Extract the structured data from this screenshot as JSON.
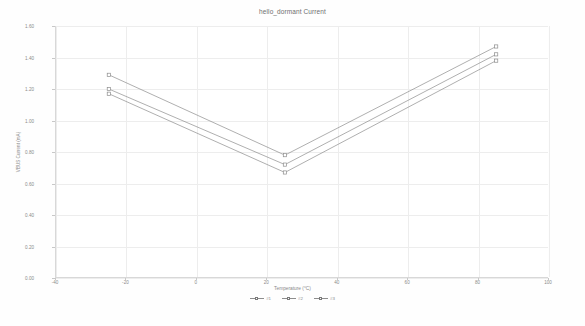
{
  "chart_data": {
    "type": "line",
    "title": "hello_dormant Current",
    "xlabel": "Temperature (°C)",
    "ylabel": "VBUS Current (mA)",
    "xlim": [
      -40,
      100
    ],
    "ylim": [
      0.0,
      1.6
    ],
    "xticks": [
      -40,
      -20,
      0,
      20,
      40,
      60,
      80,
      100
    ],
    "xtick_labels": [
      "-40",
      "-20",
      "0",
      "20",
      "40",
      "60",
      "80",
      "100"
    ],
    "yticks": [
      0.0,
      0.2,
      0.4,
      0.6,
      0.8,
      1.0,
      1.2,
      1.4,
      1.6
    ],
    "ytick_labels": [
      "0.00",
      "0.20",
      "0.40",
      "0.60",
      "0.80",
      "1.00",
      "1.20",
      "1.40",
      "1.60"
    ],
    "grid": true,
    "legend_position": "bottom",
    "x": [
      -25,
      25,
      85
    ],
    "series": [
      {
        "name": "#1",
        "color": "#8d8d8d",
        "marker": "square",
        "values": [
          1.29,
          0.78,
          1.47
        ]
      },
      {
        "name": "#2",
        "color": "#8d8d8d",
        "marker": "square",
        "values": [
          1.2,
          0.72,
          1.42
        ]
      },
      {
        "name": "#3",
        "color": "#8d8d8d",
        "marker": "square",
        "values": [
          1.17,
          0.67,
          1.38
        ]
      }
    ],
    "legend_entries": [
      "#1",
      "#2",
      "#3"
    ]
  }
}
